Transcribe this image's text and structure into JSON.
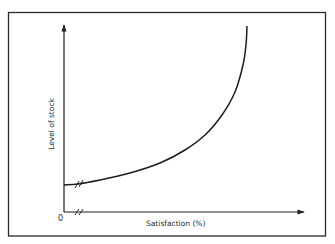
{
  "chart_data": {
    "type": "line",
    "title": "",
    "xlabel": "Satisfaction (%)",
    "ylabel": "Level of stock",
    "origin_label": "0",
    "axis_breaks": [
      "x-axis near origin",
      "y-intercept of curve"
    ],
    "grid": false,
    "legend": null,
    "series": [
      {
        "name": "Level of stock vs satisfaction",
        "description": "Stock rises slowly at low satisfaction, then increases steeply (asymptotically) as satisfaction approaches 100%",
        "points_px": [
          [
            64,
            185
          ],
          [
            78,
            184
          ],
          [
            100,
            180
          ],
          [
            130,
            173
          ],
          [
            160,
            163
          ],
          [
            185,
            150
          ],
          [
            205,
            135
          ],
          [
            222,
            115
          ],
          [
            235,
            92
          ],
          [
            243,
            65
          ],
          [
            246,
            45
          ],
          [
            247,
            26
          ]
        ]
      }
    ]
  },
  "colors": {
    "line": "#1e1e1e",
    "frame": "#2a2a2a",
    "background": "#ffffff"
  }
}
